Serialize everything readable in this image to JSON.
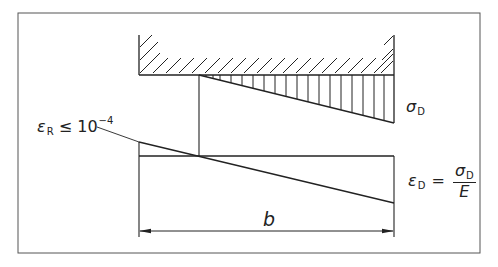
{
  "figure": {
    "labels": {
      "sigma_symbol": "σ",
      "sigma_sub": "D",
      "eps_d_symbol": "ε",
      "eps_d_sub": "D",
      "equals": "=",
      "frac_num_symbol": "σ",
      "frac_num_sub": "D",
      "frac_den": "E",
      "eps_r_symbol": "ε",
      "eps_r_sub": "R",
      "leq": "≤",
      "eps_r_base": "10",
      "eps_r_exp": "−4",
      "width": "b"
    },
    "colors": {
      "line": "#222222",
      "frame": "#555555",
      "background": "#ffffff"
    }
  }
}
